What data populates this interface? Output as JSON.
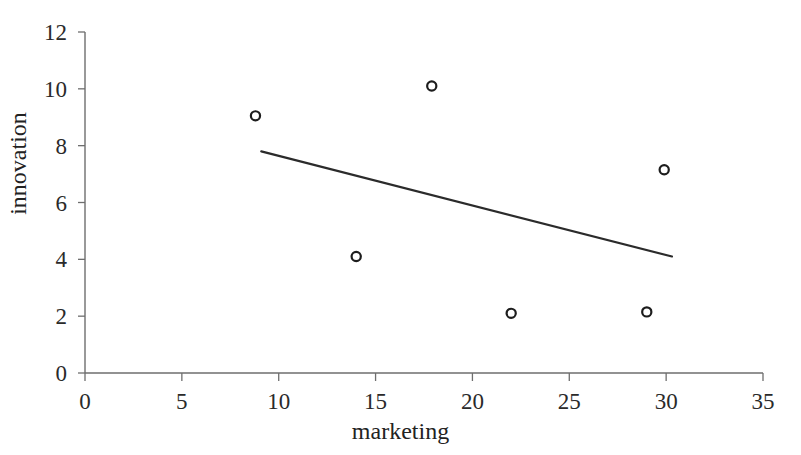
{
  "chart_data": {
    "type": "scatter",
    "title": "",
    "xlabel": "marketing",
    "ylabel": "innovation",
    "xlim": [
      0,
      35
    ],
    "ylim": [
      0,
      12
    ],
    "xticks": [
      0,
      5,
      10,
      15,
      20,
      25,
      30,
      35
    ],
    "yticks": [
      0,
      2,
      4,
      6,
      8,
      10,
      12
    ],
    "grid": false,
    "legend": null,
    "marker": "open-circle",
    "series": [
      {
        "name": "observations",
        "points": [
          {
            "x": 8.8,
            "y": 9.05
          },
          {
            "x": 14.0,
            "y": 4.1
          },
          {
            "x": 17.9,
            "y": 10.1
          },
          {
            "x": 22.0,
            "y": 2.1
          },
          {
            "x": 29.0,
            "y": 2.15
          },
          {
            "x": 29.9,
            "y": 7.15
          }
        ]
      }
    ],
    "trendline": {
      "name": "linear fit",
      "x_start": 9.1,
      "y_start": 7.8,
      "x_end": 30.3,
      "y_end": 4.1
    },
    "colors": {
      "axis": "#6e6e6e",
      "marker": "#1d1d1d",
      "trendline": "#2b2b2b",
      "text": "#222222",
      "background": "#ffffff"
    }
  },
  "axes": {
    "x_tick_labels": [
      "0",
      "5",
      "10",
      "15",
      "20",
      "25",
      "30",
      "35"
    ],
    "y_tick_labels": [
      "0",
      "2",
      "4",
      "6",
      "8",
      "10",
      "12"
    ],
    "x_title": "marketing",
    "y_title": "innovation"
  }
}
